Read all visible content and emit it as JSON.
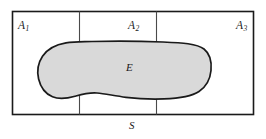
{
  "figure": {
    "name": "partition-venn-diagram",
    "universe_label": "S",
    "event_label": "E",
    "regions": [
      {
        "id": "A1",
        "base": "A",
        "subscript": "1"
      },
      {
        "id": "A2",
        "base": "A",
        "subscript": "2"
      },
      {
        "id": "A3",
        "base": "A",
        "subscript": "3"
      }
    ],
    "colors": {
      "stroke": "#1a1a1a",
      "divider": "#4a4a4a",
      "event_fill": "#d9d9d9",
      "background": "#ffffff"
    },
    "geometry": {
      "rect": {
        "x": 12,
        "y": 11,
        "width": 242,
        "height": 104
      },
      "dividers_x": [
        79,
        156
      ],
      "blob_bounds": {
        "left": 38,
        "right": 211,
        "top": 41,
        "bottom": 99
      }
    }
  }
}
